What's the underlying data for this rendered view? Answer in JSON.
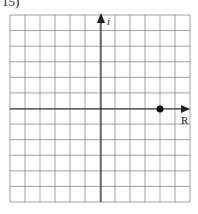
{
  "problem": {
    "number_label": "15)"
  },
  "grid": {
    "left": 10,
    "top": 15,
    "right": 190,
    "bottom": 202,
    "columns": 12,
    "rows": 12,
    "line_color": "#8a8a8a",
    "axis_color": "#222222"
  },
  "axes": {
    "horizontal_label": "R",
    "vertical_label": "i",
    "origin_x": 101,
    "origin_y": 109
  },
  "point": {
    "cx": 160,
    "cy": 109,
    "r": 3.5,
    "color": "#111111",
    "units_right_of_origin": 4
  }
}
